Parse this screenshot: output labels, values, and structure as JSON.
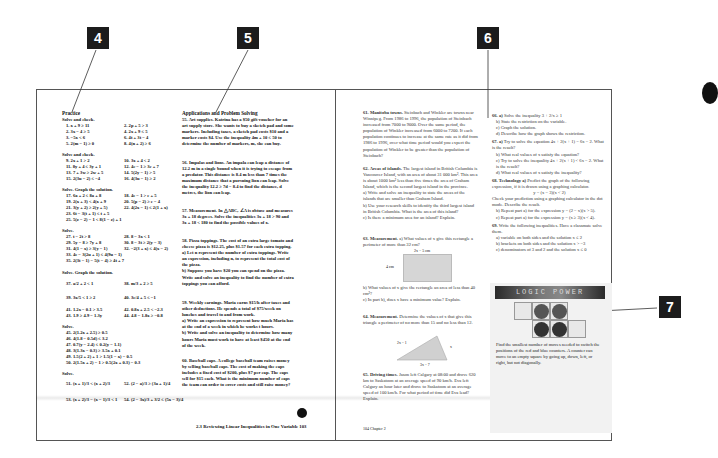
{
  "callouts": [
    {
      "id": "4",
      "label": "4"
    },
    {
      "id": "5",
      "label": "5"
    },
    {
      "id": "6",
      "label": "6"
    },
    {
      "id": "7",
      "label": "7"
    }
  ],
  "left_page": {
    "practice": {
      "heading": "Practice",
      "groups": [
        {
          "title": "Solve and check.",
          "items_left": [
            "1. x + 9 ≥ 11",
            "2. 3x − 4 ≥ 5",
            "3. −5x < 6",
            "5. 2(m − 1) ≥ 0"
          ],
          "items_right": [
            "2. 2p + 5 > 3",
            "4. 2x + 9 ≤ 5",
            "6. 4t + 3t − 4",
            "8. 4(n + 2) ≥ 6"
          ]
        },
        {
          "title": "Solve and check.",
          "items_left": [
            "9. 2x + 1 > 2",
            "11. 8y + 4 ≤ 3y + 1",
            "13. 7 + 3w ≥ 2w + 5",
            "15. 2(3u − 2) ≤ −4"
          ],
          "items_right": [
            "10. 3x + 4 < 2",
            "12. 4c − 1 ≥ 3c + 7",
            "14. 5(2y − 1) > 5",
            "16. 4(3u − 1) ≥ 2"
          ]
        },
        {
          "title": "Solve. Graph the solution.",
          "items_left": [
            "17. 6a + 2 ≤ 8a + 8",
            "19. 2(x + 3) < 4(x + 9",
            "21. 3(y + 2) ≥ 2(y + 5)",
            "23. 6t − 3(t + 1) ≤ t + 5",
            "25. 5(z − 2) − 1 < 8(1 − z) + 1"
          ],
          "items_right": [
            "18. 4e − 1 > e + 5",
            "20. 5(p − 2) ≥ e − 4",
            "22. 4(2x − 1) ≤ 2(1 + x)"
          ]
        },
        {
          "title": "Solve.",
          "items_left": [
            "27. t − 2t > 8",
            "29. 5y − 8 ≥ 7y + 8",
            "31. 4(1 − x) ≥ 3(y − 1)",
            "33. 4e − 3(2u + 1) ≤ 4(9u − 1)",
            "35. 2(3t − 1) − 5(t − 4) ≥ 4t + 7"
          ],
          "items_right": [
            "28. 8 − 3x < 1",
            "30. 8 − 3t ≥ 2(y − 3)",
            "32. −2(3 + x) ≤ 4(x − 2)"
          ]
        },
        {
          "title": "Solve. Graph the solution.",
          "items_left": [
            "37. a/2 + 2 < 1",
            "39. 3x/5 < 1 ≥ 2",
            "41. 1.2x − 0.1 > 3.5",
            "43. 1.9 ≥ 4.9 − 1.3y"
          ],
          "items_right": [
            "38. m/3 + 2 ≥ 5",
            "40. 3e/4 + 5 ≤ −1",
            "42. 0.8x + 2.5 < −2.3",
            "44. 4.8 − 1.8x ≥ −0.8"
          ]
        },
        {
          "title": "Solve.",
          "items_left": [
            "45. 2(1.2x + 2.5) ≥ 0.5",
            "46. 4(1.8 − 0.5d) ≤ 3.2",
            "47. 0.7(y − 2.4) ≤ 0.2(y − 1.1)",
            "48. 3(1.3x − 0.3) ≥ 3.5x + 0.1",
            "49. 1.5(2 + 2) + 1 > 1.5(1 − x) − 0.5",
            "50. 2(1.5x + 2) − 1 > 0.5(2x + 0.3) − 0.3"
          ],
          "items_right": []
        },
        {
          "title": "Solve.",
          "items_left": [
            "51. (x + 1)/3 < (x + 2)/3",
            "53. (x + 2)/3 − (x − 1)/3 < 1"
          ],
          "items_right": [
            "52. (2 − a)/3 ≥ (3a + 1)/4",
            "54. (2 − 3x)/3 + 3/2 ≤ (5x − 3)/4"
          ]
        }
      ]
    },
    "applications": {
      "heading": "Applications and Problem Solving",
      "problems": [
        {
          "label": "55. Art supplies.",
          "text": "Katrina has a $50 gift voucher for an art supply store. She wants to buy a sketch pad and some markers. Including taxes, a sketch pad costs $10 and a marker costs $4. Use the inequality 4m + 10 ≤ 50 to determine the number of markers, m, she can buy."
        },
        {
          "label": "56. Impalas and lions.",
          "text": "An impala can leap a distance of 12.2 m in a single bound when it is trying to escape from a predator. This distance is 8.4 m less than 7 times the maximum distance that a pursuing lion can leap. Solve the inequality 12.2 ≥ 7d − 8.4 to find the distance, d metres, the lion can leap."
        },
        {
          "label": "57. Measurement.",
          "text": "In △ABC, ∠A is obtuse and measures 3x + 18 degrees. Solve the inequalities 3x + 18 > 90 and 3x + 18 < 180 to find the possible values of x."
        },
        {
          "label": "58. Pizza toppings.",
          "text": "The cost of an extra large tomato and cheese pizza is $12.25, plus $1.57 for each extra topping."
        },
        {
          "label": "a)",
          "text": "Let n represent the number of extra toppings. Write an expression, including n, to represent the total cost of the pizza."
        },
        {
          "label": "b)",
          "text": "Suppose you have $20 you can spend on the pizza. Write and solve an inequality to find the number of extra toppings you can afford."
        },
        {
          "label": "59. Weekly earnings.",
          "text": "Maria earns $15/h after taxes and other deductions. He spends a total of $75/week on lunches and travel to and from work."
        },
        {
          "label": "a)",
          "text": "Write an expression to represent how much Maria has at the end of a week in which he works t hours."
        },
        {
          "label": "b)",
          "text": "Write and solve an inequality to determine how many hours Maria must work to have at least $450 at the end of the week."
        },
        {
          "label": "60. Baseball caps.",
          "text": "A college baseball team raises money by selling baseball caps. The cost of making the caps includes a fixed cost of $200, plus $7 per cap. The caps sell for $15 each. What is the minimum number of caps the team can order to cover costs and still raise money?"
        }
      ]
    },
    "footer": "2.3 Reviewing Linear Inequalities in One Variable   103"
  },
  "right_page": {
    "left_column": [
      {
        "label": "61. Manitoba towns.",
        "text": "Steinbach and Winkler are towns near Winnipeg. From 1986 to 1996, the population of Steinbach increased from 7000 to 9000. Over the same period, the population of Winkler increased from 6000 to 7200. If each population continues to increase at the same rate as it did from 1986 to 1996, over what time period would you expect the population of Winkler to be greater than the population of Steinbach?"
      },
      {
        "label": "62. Areas of islands.",
        "text": "The largest island in British Columbia is Vancouver Island, with an area of about 31 000 km². This area is about 1000 km² less than five times the area of Graham Island, which is the second largest island in the province."
      },
      {
        "label": "a)",
        "text": "Write and solve an inequality to state the areas of the islands that are smaller than Graham Island."
      },
      {
        "label": "b)",
        "text": "Use your research skills to identify the third largest island in British Columbia. What is the area of this island?"
      },
      {
        "label": "c)",
        "text": "Is there a minimum area for an island? Explain."
      },
      {
        "label": "63. Measurement.",
        "text": "a) What values of x give this rectangle a perimeter of more than 32 cm?"
      },
      {
        "label": "b)",
        "text": "What values of x give the rectangle an area of less than 40 cm²?"
      },
      {
        "label": "c)",
        "text": "In part b), does x have a minimum value? Explain."
      },
      {
        "label": "64. Measurement.",
        "text": "Determine the values of x that give this triangle a perimeter of no more than 15 and no less than 12."
      },
      {
        "label": "65. Driving times.",
        "text": "Jason left Calgary at 08:00 and drove 620 km to Saskatoon at an average speed of 90 km/h. Eva left Calgary an hour later and drove to Saskatoon at an average speed of 100 km/h. For what period of time did Eva lead? Explain."
      }
    ],
    "rectangle_diagram": {
      "top_label": "2x − 5 cm",
      "side_label": "4 cm"
    },
    "triangle_diagram": {
      "left_label": "2x − 1",
      "right_label": "x",
      "bottom_label": "3x − 7"
    },
    "right_column": [
      {
        "label": "66. a)",
        "text": "Solve the inequality 3 + 2/x ≥ 1"
      },
      {
        "label": "b)",
        "text": "State the restriction on the variable."
      },
      {
        "label": "c)",
        "text": "Graph the solution."
      },
      {
        "label": "d)",
        "text": "Describe how the graph shows the restriction."
      },
      {
        "label": "67. a)",
        "text": "Try to solve the equation 4x + 2(x + 1) = 6x − 2. What is the result?"
      },
      {
        "label": "b)",
        "text": "What real values of x satisfy the equation?"
      },
      {
        "label": "c)",
        "text": "Try to solve the inequality 4x + 2(x + 1) < 6x − 2. What is the result?"
      },
      {
        "label": "d)",
        "text": "What real values of x satisfy the inequality?"
      },
      {
        "label": "68. Technology a)",
        "text": "Predict the graph of the following expression, if it is drawn using a graphing calculator."
      },
      {
        "label": "",
        "text": "y = (x − 3)(x < 2)"
      },
      {
        "label": "",
        "text": "Check your prediction using a graphing calculator in the dot mode. Describe the result."
      },
      {
        "label": "b)",
        "text": "Repeat part a) for the expression y = (2 − x)(x > 5)."
      },
      {
        "label": "c)",
        "text": "Repeat part a) for the expression y = (x ≥ 3)(x < 4)."
      },
      {
        "label": "69.",
        "text": "Write the following inequalities. Have a classmate solve them."
      },
      {
        "label": "a)",
        "text": "variable on both sides and the solution x ≤ 2"
      },
      {
        "label": "b)",
        "text": "brackets on both sides and the solution x > −3"
      },
      {
        "label": "c)",
        "text": "denominators of 3 and 2 and the solution x ≤ 0"
      }
    ],
    "logic_power": {
      "banner": "LOGIC POWER",
      "text": "Find the smallest number of moves needed to switch the positions of the red and blue counters. A counter can move to an empty square by going up, down, left, or right, but not diagonally."
    },
    "footer": "104   Chapter 2"
  }
}
